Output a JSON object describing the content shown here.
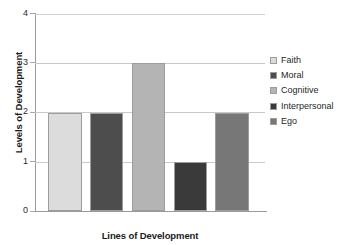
{
  "chart_data": {
    "type": "bar",
    "title": "",
    "xlabel": "Lines of Development",
    "ylabel": "Levels of Development",
    "categories": [
      "Faith",
      "Moral",
      "Cognitive",
      "Interpersonal",
      "Ego"
    ],
    "values": [
      2,
      2,
      3,
      1,
      2
    ],
    "series": [
      {
        "name": "Levels of Development",
        "values": [
          2,
          2,
          3,
          1,
          2
        ]
      }
    ],
    "ylim": [
      0,
      4
    ],
    "yticks": [
      "0",
      "1",
      "2",
      "3",
      "4"
    ],
    "xticks": [],
    "grid": true,
    "legend_position": "right",
    "bar_colors": [
      "#dcdcdc",
      "#4d4d4d",
      "#b4b4b4",
      "#3a3a3a",
      "#777777"
    ],
    "bar_border_color": "#9d9d9d",
    "axis_color": "#9a9a9a",
    "gridline_color": "#c9c9c9",
    "background_color": "#ffffff"
  },
  "legend": {
    "items": [
      {
        "label": "Faith",
        "color": "#dcdcdc"
      },
      {
        "label": "Moral",
        "color": "#4d4d4d"
      },
      {
        "label": "Cognitive",
        "color": "#b4b4b4"
      },
      {
        "label": "Interpersonal",
        "color": "#3a3a3a"
      },
      {
        "label": "Ego",
        "color": "#777777"
      }
    ]
  },
  "axes": {
    "y_title": "Levels of Development",
    "x_title": "Lines of Development",
    "y_tick_labels": [
      "4",
      "3",
      "2",
      "1",
      "0"
    ]
  }
}
